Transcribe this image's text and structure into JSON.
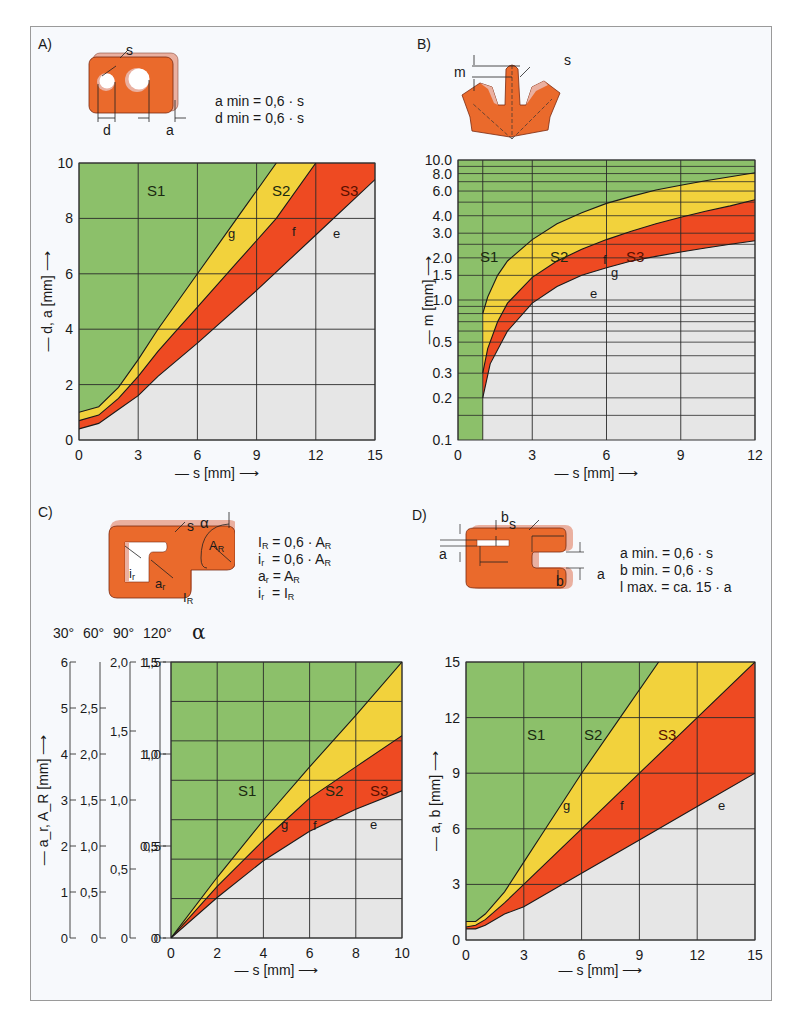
{
  "colors": {
    "s1": "#8cc06a",
    "s2": "#f2d23c",
    "s3": "#ee4a22",
    "below": "#e6e6e6",
    "grid": "#2a2a2a",
    "part": "#ea6a2c",
    "part_edge": "#eab0a0"
  },
  "panels": {
    "A": {
      "label": "A)",
      "formulas": [
        "a min = 0,6 · s",
        "d min = 0,6 · s"
      ],
      "dim_labels": {
        "s": "s",
        "d": "d",
        "a": "a"
      }
    },
    "B": {
      "label": "B)",
      "dim_labels": {
        "m": "m",
        "s": "s"
      }
    },
    "C": {
      "label": "C)",
      "formulas": [
        "I_R = 0,6 · A_R",
        "i_r = 0,6 · A_R",
        "a_r = A_R",
        "i_r = I_R"
      ],
      "dim_labels": {
        "s": "s",
        "alpha": "α",
        "AR": "A",
        "ir": "i",
        "ar": "a",
        "IR": "I"
      },
      "alpha_scale_labels": [
        "30°",
        "60°",
        "90°",
        "120°"
      ],
      "alpha_symbol": "α"
    },
    "D": {
      "label": "D)",
      "formulas": [
        "a min. = 0,6 · s",
        "b min. = 0,6 · s",
        "l max. = ca. 15 · a"
      ],
      "dim_labels": {
        "a": "a",
        "b": "b",
        "l": "l",
        "s": "s"
      }
    }
  },
  "chart_data": [
    {
      "id": "A",
      "type": "area",
      "title": "A)",
      "xlabel": "— s [mm] →",
      "ylabel": "— d, a [mm] →",
      "xlim": [
        0,
        15
      ],
      "ylim": [
        0,
        10
      ],
      "xticks": [
        0,
        3,
        6,
        9,
        12,
        15
      ],
      "yticks": [
        0,
        2,
        4,
        6,
        8,
        10
      ],
      "grid": true,
      "regions": [
        "S1",
        "S2",
        "S3"
      ],
      "series": [
        {
          "name": "g",
          "x": [
            0,
            1,
            2,
            3,
            4,
            5,
            6,
            7,
            8,
            9,
            10
          ],
          "values": [
            1.0,
            1.2,
            1.9,
            2.9,
            4.0,
            5.0,
            6.0,
            7.0,
            8.0,
            9.0,
            10.0
          ]
        },
        {
          "name": "f",
          "x": [
            0,
            1,
            2,
            3,
            4,
            5,
            6,
            8,
            10,
            12
          ],
          "values": [
            0.7,
            0.9,
            1.5,
            2.3,
            3.2,
            4.0,
            4.8,
            6.4,
            8.0,
            10.0
          ]
        },
        {
          "name": "e",
          "x": [
            0,
            1,
            2,
            3,
            4,
            6,
            9,
            12,
            15
          ],
          "values": [
            0.4,
            0.6,
            1.1,
            1.6,
            2.3,
            3.5,
            5.4,
            7.4,
            9.4
          ]
        }
      ]
    },
    {
      "id": "B",
      "type": "area",
      "title": "B)",
      "xlabel": "— s [mm] →",
      "ylabel": "— m [mm] →",
      "xlim": [
        0,
        12
      ],
      "ylim": [
        0.1,
        10.0
      ],
      "yscale": "log",
      "xticks": [
        0,
        3,
        6,
        9,
        12
      ],
      "yticks": [
        0.1,
        0.2,
        0.3,
        0.5,
        1.0,
        1.5,
        2.0,
        3.0,
        4.0,
        6.0,
        8.0,
        10.0
      ],
      "ytick_labels": [
        "0.1",
        "0.2",
        "0.3",
        "0.5",
        "1.0",
        "1.5",
        "2.0",
        "3.0",
        "4.0",
        "6.0",
        "8.0",
        "10.0"
      ],
      "grid": true,
      "regions": [
        "S1",
        "S2",
        "S3"
      ],
      "series": [
        {
          "name": "g",
          "x": [
            1,
            1.2,
            1.6,
            2,
            3,
            4,
            5,
            6,
            7,
            8,
            9,
            10,
            11,
            12
          ],
          "values": [
            0.8,
            1.05,
            1.5,
            1.9,
            2.7,
            3.5,
            4.2,
            4.9,
            5.5,
            6.1,
            6.6,
            7.1,
            7.6,
            8.1
          ]
        },
        {
          "name": "f",
          "x": [
            1,
            1.2,
            1.6,
            2,
            3,
            4,
            5,
            6,
            7,
            8,
            9,
            10,
            11,
            12
          ],
          "values": [
            0.3,
            0.45,
            0.7,
            0.95,
            1.45,
            1.9,
            2.3,
            2.7,
            3.1,
            3.5,
            3.9,
            4.3,
            4.7,
            5.2
          ]
        },
        {
          "name": "e",
          "x": [
            1,
            1.3,
            2,
            3,
            4,
            5,
            6,
            7,
            8,
            9,
            10,
            11,
            12
          ],
          "values": [
            0.2,
            0.35,
            0.6,
            0.95,
            1.25,
            1.5,
            1.7,
            1.9,
            2.05,
            2.2,
            2.35,
            2.5,
            2.65
          ]
        }
      ]
    },
    {
      "id": "C",
      "type": "area",
      "title": "C)",
      "xlabel": "— s [mm] →",
      "ylabel": "— a_r, A_R [mm] →",
      "xlim": [
        0,
        10
      ],
      "ylim": [
        0,
        1.5
      ],
      "xticks": [
        0,
        2,
        4,
        6,
        8,
        10
      ],
      "yticks": [
        0,
        0.5,
        1.0,
        1.5
      ],
      "ytick_labels": [
        "0",
        "0,5",
        "1,0",
        "1,5"
      ],
      "extra_axes": [
        {
          "alpha": "30°",
          "ticks": [
            "0",
            "1",
            "2",
            "3",
            "4",
            "5",
            "6"
          ],
          "max": 6
        },
        {
          "alpha": "60°",
          "ticks": [
            "0",
            "0,5",
            "1,0",
            "1,5",
            "2,0",
            "2,5"
          ],
          "max": 3
        },
        {
          "alpha": "90°",
          "ticks": [
            "0",
            "0,5",
            "1,0",
            "1,5",
            "2,0"
          ],
          "max": 2
        },
        {
          "alpha": "120°",
          "ticks": [
            "0",
            "0,5",
            "1,0",
            "1,5"
          ],
          "max": 1.5
        }
      ],
      "grid": true,
      "regions": [
        "S1",
        "S2",
        "S3"
      ],
      "series": [
        {
          "name": "g",
          "x": [
            0,
            2,
            4,
            6,
            8,
            10
          ],
          "values": [
            0,
            0.33,
            0.64,
            0.93,
            1.21,
            1.5
          ]
        },
        {
          "name": "f",
          "x": [
            0,
            2,
            4,
            6,
            8,
            10
          ],
          "values": [
            0,
            0.28,
            0.53,
            0.76,
            0.93,
            1.1
          ]
        },
        {
          "name": "e",
          "x": [
            0,
            2,
            4,
            6,
            8,
            10
          ],
          "values": [
            0,
            0.22,
            0.42,
            0.58,
            0.7,
            0.8
          ]
        }
      ]
    },
    {
      "id": "D",
      "type": "area",
      "title": "D)",
      "xlabel": "— s [mm] →",
      "ylabel": "— a, b [mm] →",
      "xlim": [
        0,
        15
      ],
      "ylim": [
        0,
        15
      ],
      "xticks": [
        0,
        3,
        6,
        9,
        12,
        15
      ],
      "yticks": [
        0,
        3,
        6,
        9,
        12,
        15
      ],
      "grid": true,
      "regions": [
        "S1",
        "S2",
        "S3"
      ],
      "series": [
        {
          "name": "g",
          "x": [
            0,
            0.5,
            1,
            2,
            3,
            4,
            6,
            8,
            10
          ],
          "values": [
            1.0,
            1.0,
            1.4,
            2.6,
            4.2,
            5.8,
            9.0,
            12.0,
            15.0
          ]
        },
        {
          "name": "f",
          "x": [
            0,
            0.5,
            1,
            2,
            3,
            6,
            9,
            12,
            15
          ],
          "values": [
            0.7,
            0.8,
            1.1,
            2.0,
            3.0,
            6.0,
            9.0,
            12.0,
            15.0
          ]
        },
        {
          "name": "e",
          "x": [
            0,
            0.5,
            1,
            2,
            3,
            6,
            9,
            12,
            15
          ],
          "values": [
            0.6,
            0.6,
            0.8,
            1.4,
            1.8,
            3.6,
            5.4,
            7.2,
            9.0
          ]
        }
      ]
    }
  ]
}
